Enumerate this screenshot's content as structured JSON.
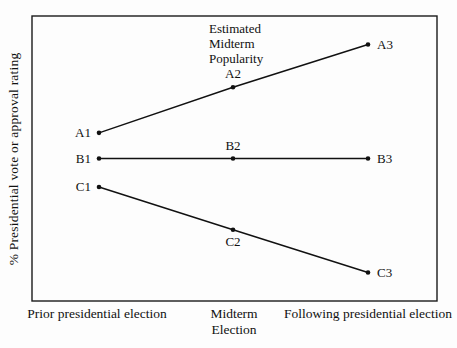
{
  "figure": {
    "y_axis_label": "% Presidential vote or approval rating",
    "annotation": {
      "lines": [
        "Estimated",
        "Midterm",
        "Popularity"
      ]
    },
    "x_axis": {
      "labels": [
        {
          "lines": [
            "Prior presidential election"
          ]
        },
        {
          "lines": [
            "Midterm",
            "Election"
          ]
        },
        {
          "lines": [
            "Following presidential election"
          ]
        }
      ]
    }
  },
  "chart_data": {
    "type": "line",
    "title": "",
    "xlabel": "",
    "ylabel": "% Presidential vote or approval rating",
    "categories": [
      "Prior presidential election",
      "Midterm Election",
      "Following presidential election"
    ],
    "axis_ticks_shown": false,
    "grid": false,
    "ylim": [
      0,
      100
    ],
    "annotation_text": "Estimated Midterm Popularity",
    "annotation_near_point": "A2",
    "line_color": "#111111",
    "marker": "filled-circle",
    "series": [
      {
        "name": "A",
        "values": [
          59,
          75,
          90
        ],
        "point_labels": [
          "A1",
          "A2",
          "A3"
        ],
        "label_placements": [
          "left",
          "above",
          "right"
        ]
      },
      {
        "name": "B",
        "values": [
          50,
          50,
          50
        ],
        "point_labels": [
          "B1",
          "B2",
          "B3"
        ],
        "label_placements": [
          "left",
          "above",
          "right"
        ]
      },
      {
        "name": "C",
        "values": [
          40,
          25,
          10
        ],
        "point_labels": [
          "C1",
          "C2",
          "C3"
        ],
        "label_placements": [
          "left",
          "below",
          "right"
        ]
      }
    ]
  }
}
